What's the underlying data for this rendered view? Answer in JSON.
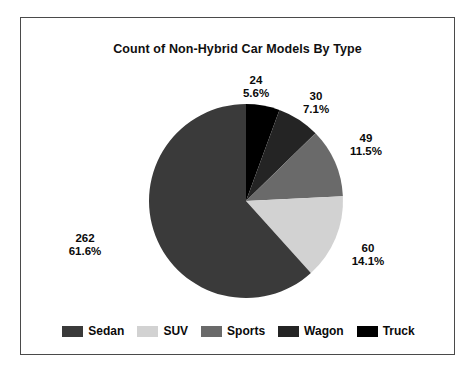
{
  "chart_data": {
    "type": "pie",
    "title": "Count of Non-Hybrid Car Models By Type",
    "xlabel": "",
    "ylabel": "",
    "total": 425,
    "legend_position": "bottom",
    "grid": false,
    "start_angle_deg": 0,
    "direction": "clockwise",
    "categories": [
      "Sedan",
      "SUV",
      "Sports",
      "Wagon",
      "Truck"
    ],
    "values": [
      262,
      60,
      49,
      30,
      24
    ],
    "percents": [
      "61.6%",
      "14.1%",
      "11.5%",
      "7.1%",
      "5.6%"
    ],
    "colors": [
      "#3a3a3a",
      "#d2d2d2",
      "#6a6a6a",
      "#242424",
      "#000000"
    ],
    "slices": [
      {
        "name": "Truck",
        "value": 24,
        "value_label": "24",
        "percent_label": "5.6%",
        "percent": 5.6,
        "color": "#000000"
      },
      {
        "name": "Wagon",
        "value": 30,
        "value_label": "30",
        "percent_label": "7.1%",
        "percent": 7.1,
        "color": "#242424"
      },
      {
        "name": "Sports",
        "value": 49,
        "value_label": "49",
        "percent_label": "11.5%",
        "percent": 11.5,
        "color": "#6a6a6a"
      },
      {
        "name": "SUV",
        "value": 60,
        "value_label": "60",
        "percent_label": "14.1%",
        "percent": 14.1,
        "color": "#d2d2d2"
      },
      {
        "name": "Sedan",
        "value": 262,
        "value_label": "262",
        "percent_label": "61.6%",
        "percent": 61.6,
        "color": "#3a3a3a"
      }
    ]
  },
  "legend": {
    "items": [
      {
        "label": "Sedan",
        "color": "#3a3a3a"
      },
      {
        "label": "SUV",
        "color": "#d2d2d2"
      },
      {
        "label": "Sports",
        "color": "#6a6a6a"
      },
      {
        "label": "Wagon",
        "color": "#242424"
      },
      {
        "label": "Truck",
        "color": "#000000"
      }
    ]
  },
  "labels": {
    "truck": {
      "value": "24",
      "percent": "5.6%"
    },
    "wagon": {
      "value": "30",
      "percent": "7.1%"
    },
    "sports": {
      "value": "49",
      "percent": "11.5%"
    },
    "suv": {
      "value": "60",
      "percent": "14.1%"
    },
    "sedan": {
      "value": "262",
      "percent": "61.6%"
    }
  }
}
